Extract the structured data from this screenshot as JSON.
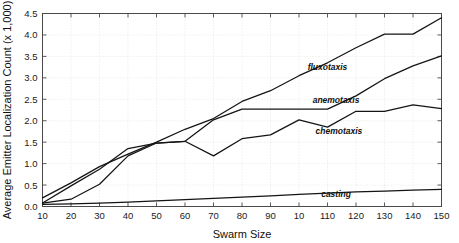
{
  "chart_data": {
    "type": "line",
    "title": "",
    "xlabel": "Swarm Size",
    "ylabel": "Average Emitter Localization Count (x 1,000)",
    "x": [
      10,
      20,
      30,
      40,
      50,
      60,
      70,
      80,
      90,
      100,
      110,
      120,
      130,
      140,
      150
    ],
    "xtick_labels": [
      "10",
      "20",
      "30",
      "40",
      "50",
      "60",
      "70",
      "80",
      "90",
      "10",
      "110",
      "120",
      "130",
      "140",
      "150"
    ],
    "ytick_labels": [
      "0.0",
      "0.5",
      "1.0",
      "1.5",
      "2.0",
      "2.5",
      "3.0",
      "3.5",
      "4.0",
      "4.5"
    ],
    "ytick_values": [
      0.0,
      0.5,
      1.0,
      1.5,
      2.0,
      2.5,
      3.0,
      3.5,
      4.0,
      4.5
    ],
    "xlim": [
      10,
      150
    ],
    "ylim": [
      0.0,
      4.5
    ],
    "grid": true,
    "legend_position": "inline-annotations",
    "series": [
      {
        "name": "fluxotaxis",
        "values": [
          0.2,
          0.55,
          0.93,
          1.22,
          1.5,
          1.8,
          2.05,
          2.45,
          2.7,
          3.05,
          3.35,
          3.7,
          4.02,
          4.02,
          4.4
        ],
        "label_x": 110,
        "label_y": 3.18
      },
      {
        "name": "anemotaxis",
        "values": [
          0.08,
          0.48,
          0.87,
          1.35,
          1.48,
          1.52,
          2.02,
          2.27,
          2.27,
          2.27,
          2.27,
          2.58,
          2.98,
          3.28,
          3.51
        ],
        "label_x": 113,
        "label_y": 2.42
      },
      {
        "name": "chemotaxis",
        "values": [
          0.08,
          0.17,
          0.52,
          1.18,
          1.48,
          1.52,
          1.18,
          1.58,
          1.67,
          2.02,
          1.85,
          2.22,
          2.22,
          2.37,
          2.28
        ],
        "label_x": 114,
        "label_y": 1.68
      },
      {
        "name": "casting",
        "values": [
          0.05,
          0.06,
          0.08,
          0.1,
          0.13,
          0.16,
          0.19,
          0.22,
          0.25,
          0.28,
          0.31,
          0.34,
          0.36,
          0.38,
          0.4
        ],
        "label_x": 113,
        "label_y": 0.23
      }
    ]
  }
}
